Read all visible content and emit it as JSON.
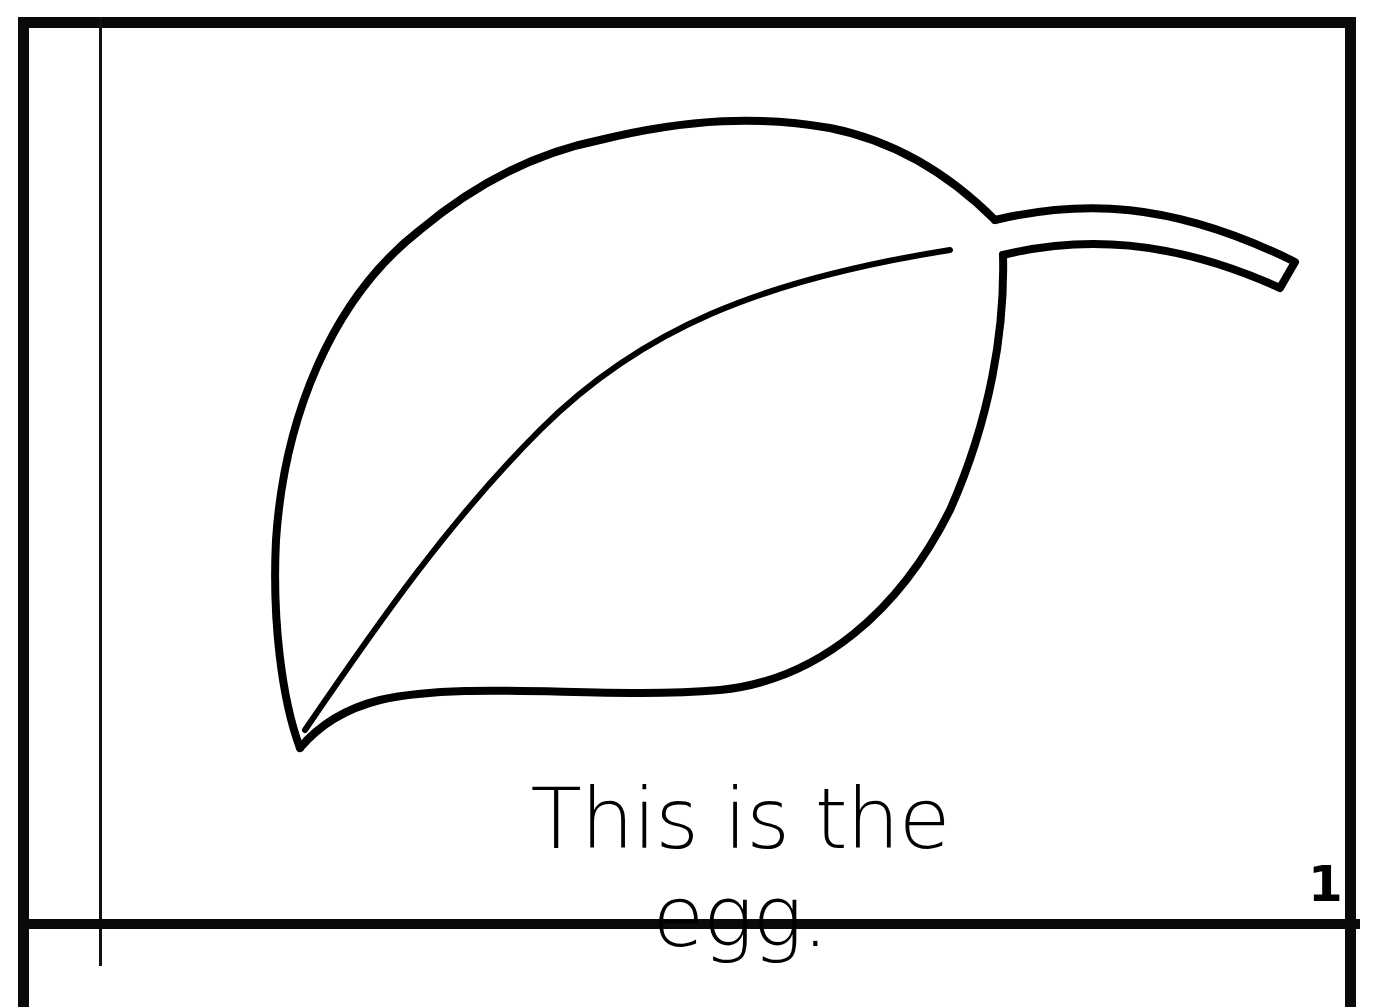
{
  "page": {
    "caption": "This is the egg.",
    "page_number": "1",
    "top_clipped_text": "...y ... p a g e",
    "illustration": "leaf-outline"
  },
  "colors": {
    "ink": "#000000",
    "paper": "#ffffff"
  }
}
